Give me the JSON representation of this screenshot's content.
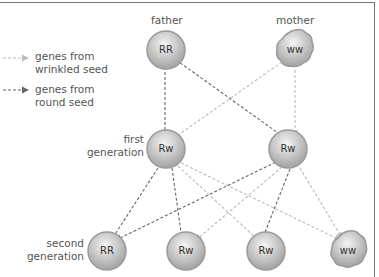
{
  "legend": {
    "items": [
      {
        "label_line1": "genes from",
        "label_line2": "wrinkled seed",
        "color": "#bbbbbb"
      },
      {
        "label_line1": "genes from",
        "label_line2": "round seed",
        "color": "#666666"
      }
    ]
  },
  "parents": {
    "father": {
      "label": "father",
      "genotype": "RR"
    },
    "mother": {
      "label": "mother",
      "genotype": "ww"
    }
  },
  "first_generation": {
    "label_line1": "first",
    "label_line2": "generation",
    "cells": [
      {
        "genotype": "Rw"
      },
      {
        "genotype": "Rw"
      }
    ]
  },
  "second_generation": {
    "label_line1": "second",
    "label_line2": "generation",
    "cells": [
      {
        "genotype": "RR"
      },
      {
        "genotype": "Rw"
      },
      {
        "genotype": "Rw"
      },
      {
        "genotype": "ww"
      }
    ]
  },
  "colors": {
    "cell_fill": "#c8c8c8",
    "cell_edge": "#9a9a9a",
    "wrinkled_line": "#bbbbbb",
    "round_line": "#666666"
  }
}
